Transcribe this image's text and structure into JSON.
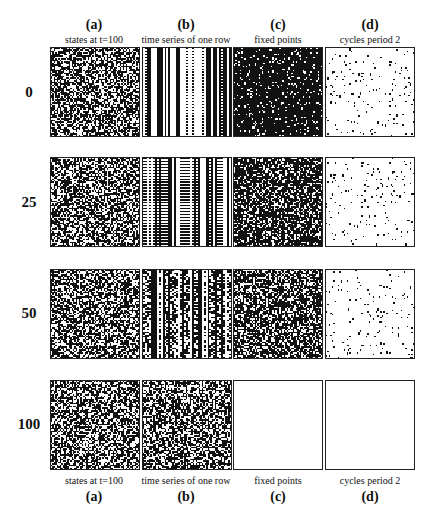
{
  "figure": {
    "columns": [
      {
        "letter": "(a)",
        "subtitle": "states at t=100"
      },
      {
        "letter": "(b)",
        "subtitle": "time series of one row"
      },
      {
        "letter": "(c)",
        "subtitle": "fixed points"
      },
      {
        "letter": "(d)",
        "subtitle": "cycles period  2"
      }
    ],
    "rows": [
      {
        "label": "0",
        "panels": [
          "noise-dense",
          "vertical-stripes",
          "sparse-white-on-black",
          "sparse-black-on-white"
        ]
      },
      {
        "label": "25",
        "panels": [
          "noise-dense",
          "vertical-stripes-dotted",
          "noise-dark",
          "sparse-black-on-white"
        ]
      },
      {
        "label": "50",
        "panels": [
          "noise-dense",
          "vertical-stripes-noisy",
          "noise-medium",
          "sparse-black-on-white"
        ]
      },
      {
        "label": "100",
        "panels": [
          "noise-dense",
          "noise-dense",
          "empty",
          "empty"
        ]
      }
    ],
    "caption_partial": "FIGURE ... (caption text clipped at bottom edge, illegible)"
  },
  "colors": {
    "ink": "#111111",
    "paper": "#ffffff",
    "border": "#222222"
  }
}
